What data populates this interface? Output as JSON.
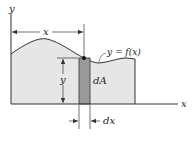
{
  "diagram": {
    "labels": {
      "y_axis": "y",
      "x_axis": "x",
      "x_dimension": "x",
      "y_dimension": "y",
      "curve": "y = f(x)",
      "element": "dA",
      "width": "dx"
    },
    "colors": {
      "region_fill": "#e6e6e6",
      "strip_fill": "#9a9a9a",
      "line": "#333333"
    }
  }
}
